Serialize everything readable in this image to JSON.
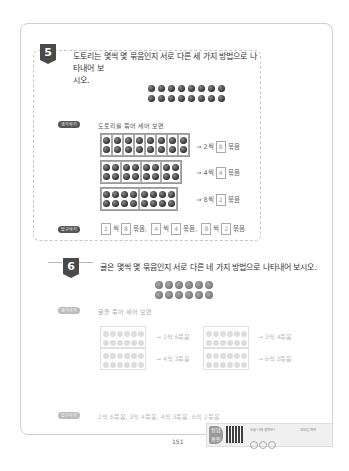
{
  "page_number": "151",
  "problem5": {
    "number": "5",
    "question": "도토리는 몇씩 몇 묶음인지 서로 다른 세 가지 방법으로 나타내어 보시오.",
    "question_line1": "도토리는 몇씩 몇 묶음인지 서로 다른 세 가지 방법으로 나타내어 보",
    "question_line2": "시오.",
    "acorn_rows": 2,
    "acorn_cols": 8,
    "approach_label": "생각하기",
    "approach_text": "도토리를 묶어 세어 보면",
    "groupings": [
      {
        "text_prefix": "→ 2씩",
        "value": "8",
        "suffix": "묶음"
      },
      {
        "text_prefix": "→ 4씩",
        "value": "4",
        "suffix": "묶음"
      },
      {
        "text_prefix": "→ 8씩",
        "value": "2",
        "suffix": "묶음"
      }
    ],
    "answer_label": "답구하기",
    "answer": {
      "parts": [
        {
          "a": "2",
          "b": "8"
        },
        {
          "a": "4",
          "b": "4"
        },
        {
          "a": "8",
          "b": "2"
        }
      ],
      "ssik": "씩",
      "mukeum": "묶음,",
      "mukeum_last": "묶음"
    }
  },
  "problem6": {
    "number": "6",
    "question": "귤은 몇씩 몇 묶음인지 서로 다른 네 가지 방법으로 나타내어 보시오.",
    "ball_rows": 2,
    "ball_cols": 6,
    "approach_label": "생각하기",
    "approach_text": "귤을 묶어 세어 보면",
    "groupings": [
      {
        "text": "→ 2씩 6묶음"
      },
      {
        "text": "→ 3씩 4묶음"
      },
      {
        "text": "→ 4씩 3묶음"
      },
      {
        "text": "→ 6씩 2묶음"
      }
    ],
    "answer_label": "답구하기",
    "answer_text": "2씩 6묶음, 3씩 4묶음, 4씩 3묶음, 6씩 2묶음"
  },
  "footer": {
    "logo_text": "정답 확인",
    "qr_question": "오늘 나의 실력은?",
    "qr_check": "부모님 확인"
  }
}
